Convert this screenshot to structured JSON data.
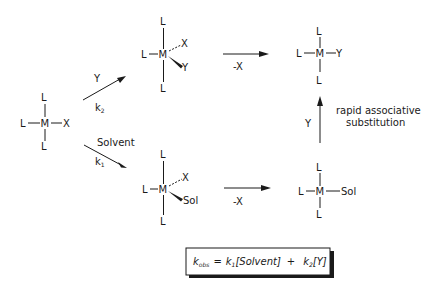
{
  "diagram": {
    "reactant": {
      "metal": "M",
      "ligand_top": "L",
      "ligand_bottom": "L",
      "ligand_left": "L",
      "ligand_right": "X"
    },
    "upper_path": {
      "arrow_reagent": "Y",
      "rate_constant": "k",
      "rate_constant_sub": "2",
      "intermediate": {
        "metal": "M",
        "ligand_top": "L",
        "ligand_bottom": "L",
        "ligand_left": "L",
        "dashed_ligand": "X",
        "wedge_ligand": "Y"
      },
      "elimination_label": "-X",
      "product": {
        "metal": "M",
        "ligand_top": "L",
        "ligand_bottom": "L",
        "ligand_left": "L",
        "ligand_right": "Y"
      }
    },
    "lower_path": {
      "arrow_reagent": "Solvent",
      "rate_constant": "k",
      "rate_constant_sub": "1",
      "intermediate": {
        "metal": "M",
        "ligand_top": "L",
        "ligand_bottom": "L",
        "ligand_left": "L",
        "dashed_ligand": "X",
        "wedge_ligand": "Sol"
      },
      "elimination_label": "-X",
      "product": {
        "metal": "M",
        "ligand_top": "L",
        "ligand_bottom": "L",
        "ligand_left": "L",
        "ligand_right": "Sol"
      }
    },
    "conversion": {
      "reagent": "Y",
      "description_line1": "rapid associative",
      "description_line2": "substitution"
    },
    "rate_law": {
      "lhs": "k",
      "lhs_sub": "obs",
      "equals": "=",
      "term1_k": "k",
      "term1_sub": "1",
      "term1_bracket": "[Solvent]",
      "plus": "+",
      "term2_k": "k",
      "term2_sub": "2",
      "term2_bracket": "[Y]"
    }
  }
}
